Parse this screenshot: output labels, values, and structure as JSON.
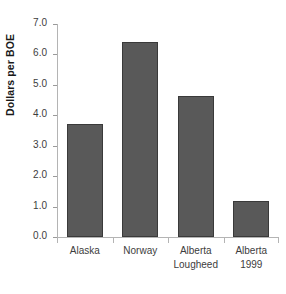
{
  "chart_data": {
    "type": "bar",
    "title": "",
    "subtitle": "",
    "xlabel": "",
    "ylabel": "Dollars per BOE",
    "categories": [
      "Alaska",
      "Norway",
      "Alberta Lougheed",
      "Alberta 1999"
    ],
    "category_lines": [
      [
        "Alaska"
      ],
      [
        "Norway"
      ],
      [
        "Alberta",
        "Lougheed"
      ],
      [
        "Alberta",
        "1999"
      ]
    ],
    "values": [
      3.7,
      6.4,
      4.65,
      1.2
    ],
    "ylim": [
      0.0,
      7.0
    ],
    "ytick_step": 1.0,
    "ytick_labels": [
      "7.0",
      "6.0",
      "5.0",
      "4.0",
      "3.0",
      "2.0",
      "1.0",
      "0.0"
    ],
    "ytick_values": [
      7.0,
      6.0,
      5.0,
      4.0,
      3.0,
      2.0,
      1.0,
      0.0
    ],
    "grid": false,
    "legend": false,
    "legend_position": "none",
    "bar_color": "#595959",
    "bar_edge_color": "#3a3a3a",
    "axis_color": "#b4b4b4",
    "text_color": "#3d3d3d",
    "background": "#ffffff"
  }
}
